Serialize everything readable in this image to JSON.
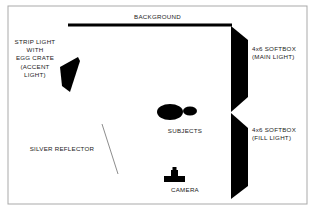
{
  "diagram": {
    "kind": "photography-lighting-diagram",
    "canvas": {
      "width": 315,
      "height": 210
    },
    "colors": {
      "paper": "#ffffff",
      "ink": "#000000",
      "text": "#1b1b1b",
      "frame": "#a9a9a9",
      "reflector_line": "#8d8d8d"
    },
    "frame": {
      "x": 8,
      "y": 6,
      "width": 299,
      "height": 198,
      "stroke": "#a9a9a9",
      "stroke_width": 1
    }
  },
  "labels": {
    "background": "BACKGROUND",
    "strip_light": "STRIP LIGHT\nWITH\nEGG CRATE\n(ACCENT\nLIGHT)",
    "softbox_main": "4x6 SOFTBOX\n(MAIN LIGHT)",
    "softbox_fill": "4x6 SOFTBOX\n(FILL LIGHT)",
    "subjects": "SUBJECTS",
    "camera": "CAMERA",
    "silver_reflector": "SILVER REFLECTOR"
  },
  "elements": {
    "background_bar": {
      "name": "background-bar",
      "x1": 68,
      "y1": 25,
      "x2": 232,
      "y2": 25,
      "stroke": "#000000",
      "stroke_width": 3.2
    },
    "strip_light": {
      "name": "strip-light-softbox",
      "points": "60,67 78,57 80,61 70,92 62,86",
      "fill": "#000000"
    },
    "softbox_main": {
      "name": "softbox-main-light",
      "points": "231,26 248,40 248,97 231,112 231,26",
      "fill": "#000000"
    },
    "softbox_fill": {
      "name": "softbox-fill-light",
      "points": "231,113 248,128 248,186 231,199 231,113",
      "fill": "#000000"
    },
    "subject_large": {
      "name": "subject-primary",
      "cx": 170,
      "cy": 112,
      "rx": 13,
      "ry": 8,
      "fill": "#000000"
    },
    "subject_small": {
      "name": "subject-secondary",
      "cx": 190,
      "cy": 111,
      "rx": 7,
      "ry": 4.5,
      "fill": "#000000"
    },
    "camera_body": {
      "name": "camera-body",
      "x": 164,
      "y": 176,
      "width": 21,
      "height": 6,
      "fill": "#000000"
    },
    "camera_lens": {
      "name": "camera-lens",
      "x": 171,
      "y": 170,
      "width": 7,
      "height": 6,
      "fill": "#000000"
    },
    "camera_hotshoe": {
      "name": "camera-hot-shoe",
      "x": 172.5,
      "y": 167,
      "width": 4,
      "height": 3,
      "fill": "#000000"
    },
    "reflector_line": {
      "name": "silver-reflector-line",
      "x1": 102,
      "y1": 124,
      "x2": 118,
      "y2": 174,
      "stroke": "#8d8d8d",
      "stroke_width": 1
    }
  }
}
